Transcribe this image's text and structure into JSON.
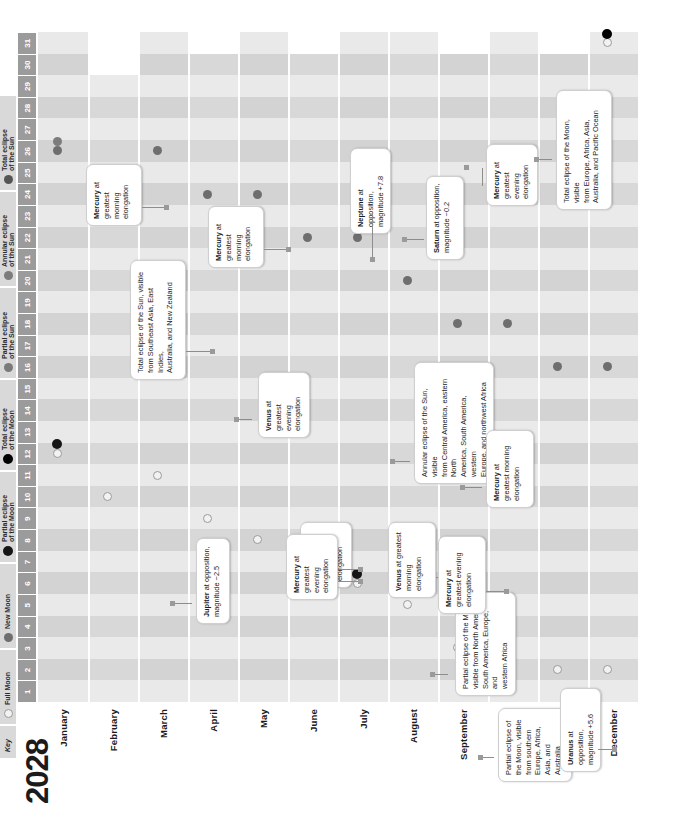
{
  "year": "2028",
  "key": {
    "title": "Key",
    "items": [
      {
        "label": "Full Moon",
        "icon": "full-moon-icon",
        "glyph": "dot-full"
      },
      {
        "label": "New Moon",
        "icon": "new-moon-icon",
        "glyph": "dot-new"
      },
      {
        "label": "Partial eclipse\nof the Moon",
        "icon": "partial-lunar-eclipse-icon",
        "glyph": "dot-plunar"
      },
      {
        "label": "Total eclipse\nof the Moon",
        "icon": "total-lunar-eclipse-icon",
        "glyph": "dot-tlunar"
      },
      {
        "label": "Partial eclipse\nof the Sun",
        "icon": "partial-solar-eclipse-icon",
        "glyph": "dot-psolar"
      },
      {
        "label": "Annular eclipse\nof the Sun",
        "icon": "annular-solar-eclipse-icon",
        "glyph": "dot-asolar"
      },
      {
        "label": "Total eclipse\nof the Sun",
        "icon": "total-solar-eclipse-icon",
        "glyph": "dot-tsolar"
      }
    ]
  },
  "days": [
    "1",
    "2",
    "3",
    "4",
    "5",
    "6",
    "7",
    "8",
    "9",
    "10",
    "11",
    "12",
    "13",
    "14",
    "15",
    "16",
    "17",
    "18",
    "19",
    "20",
    "21",
    "22",
    "23",
    "24",
    "25",
    "26",
    "27",
    "28",
    "29",
    "30",
    "31"
  ],
  "months": [
    {
      "name": "January",
      "days": 31
    },
    {
      "name": "February",
      "days": 29
    },
    {
      "name": "March",
      "days": 31
    },
    {
      "name": "April",
      "days": 30
    },
    {
      "name": "May",
      "days": 31
    },
    {
      "name": "June",
      "days": 30
    },
    {
      "name": "July",
      "days": 31
    },
    {
      "name": "August",
      "days": 31
    },
    {
      "name": "September",
      "days": 30
    },
    {
      "name": "October",
      "days": 31
    },
    {
      "name": "November",
      "days": 30
    },
    {
      "name": "December",
      "days": 31
    }
  ],
  "chart_data": {
    "type": "table",
    "title": "2028",
    "xlabel": "Day of month",
    "ylabel": "Month",
    "x": [
      "1",
      "2",
      "3",
      "4",
      "5",
      "6",
      "7",
      "8",
      "9",
      "10",
      "11",
      "12",
      "13",
      "14",
      "15",
      "16",
      "17",
      "18",
      "19",
      "20",
      "21",
      "22",
      "23",
      "24",
      "25",
      "26",
      "27",
      "28",
      "29",
      "30",
      "31"
    ],
    "categories": [
      "January",
      "February",
      "March",
      "April",
      "May",
      "June",
      "July",
      "August",
      "September",
      "October",
      "November",
      "December"
    ],
    "events": [
      {
        "month": "January",
        "day": 12,
        "type": "full-moon"
      },
      {
        "month": "January",
        "day": 12,
        "type": "partial-lunar-eclipse"
      },
      {
        "month": "January",
        "day": 26,
        "type": "new-moon"
      },
      {
        "month": "January",
        "day": 26,
        "type": "annular-solar-eclipse"
      },
      {
        "month": "February",
        "day": 10,
        "type": "full-moon"
      },
      {
        "month": "February",
        "day": 25,
        "type": "new-moon"
      },
      {
        "month": "March",
        "day": 11,
        "type": "full-moon"
      },
      {
        "month": "March",
        "day": 26,
        "type": "new-moon"
      },
      {
        "month": "April",
        "day": 9,
        "type": "full-moon"
      },
      {
        "month": "April",
        "day": 24,
        "type": "new-moon"
      },
      {
        "month": "May",
        "day": 8,
        "type": "full-moon"
      },
      {
        "month": "May",
        "day": 24,
        "type": "new-moon"
      },
      {
        "month": "June",
        "day": 7,
        "type": "full-moon"
      },
      {
        "month": "June",
        "day": 22,
        "type": "new-moon"
      },
      {
        "month": "July",
        "day": 6,
        "type": "full-moon"
      },
      {
        "month": "July",
        "day": 6,
        "type": "partial-lunar-eclipse"
      },
      {
        "month": "July",
        "day": 22,
        "type": "new-moon"
      },
      {
        "month": "July",
        "day": 22,
        "type": "total-solar-eclipse"
      },
      {
        "month": "August",
        "day": 5,
        "type": "full-moon"
      },
      {
        "month": "August",
        "day": 20,
        "type": "new-moon"
      },
      {
        "month": "September",
        "day": 3,
        "type": "full-moon"
      },
      {
        "month": "September",
        "day": 18,
        "type": "new-moon"
      },
      {
        "month": "October",
        "day": 3,
        "type": "full-moon"
      },
      {
        "month": "October",
        "day": 18,
        "type": "new-moon"
      },
      {
        "month": "November",
        "day": 2,
        "type": "full-moon"
      },
      {
        "month": "November",
        "day": 16,
        "type": "new-moon"
      },
      {
        "month": "December",
        "day": 2,
        "type": "full-moon"
      },
      {
        "month": "December",
        "day": 16,
        "type": "new-moon"
      },
      {
        "month": "December",
        "day": 31,
        "type": "full-moon"
      },
      {
        "month": "December",
        "day": 31,
        "type": "total-lunar-eclipse"
      }
    ],
    "annotations": [
      {
        "month": "January",
        "day": 12,
        "text": "Partial eclipse of the Moon,\nvisible from North America,\nSouth America, Europe, and\nwestern Africa",
        "bold": ""
      },
      {
        "month": "January",
        "day": 16,
        "text": "Mercury at greatest evening elongation",
        "bold": "Mercury"
      },
      {
        "month": "January",
        "day": 26,
        "text": "Annular eclipse of the Sun, visible\nfrom Central America, eastern North\nAmerica, South America, western\nEurope, and northwest Africa",
        "bold": ""
      },
      {
        "month": "February",
        "day": 29,
        "text": "Mercury at greatest morning elongation",
        "bold": "Mercury"
      },
      {
        "month": "March",
        "day": 13,
        "text": "Jupiter at opposition,\nmagnitude −2.5",
        "bold": "Jupiter"
      },
      {
        "month": "April",
        "day": 21,
        "text": "Venus at greatest evening elongation",
        "bold": "Venus"
      },
      {
        "month": "May",
        "day": 12,
        "text": "Mercury at greatest evening elongation",
        "bold": "Mercury"
      },
      {
        "month": "May",
        "day": 27,
        "text": "Mercury at greatest morning elongation",
        "bold": "Mercury"
      },
      {
        "month": "June",
        "day": 3,
        "text": "Partial eclipse of\nthe Moon, visible\nfrom southern\nEurope, Africa,\nAsia, and Australia",
        "bold": ""
      },
      {
        "month": "July",
        "day": 22,
        "text": "Total eclipse of the Sun, visible\nfrom Southeast Asia, East Indies,\nAustralia, and New Zealand",
        "bold": ""
      },
      {
        "month": "August",
        "day": 12,
        "text": "Venus at greatest morning elongation",
        "bold": "Venus"
      },
      {
        "month": "August",
        "day": 29,
        "text": "Neptune at opposition,\nmagnitude +7.8",
        "bold": "Neptune"
      },
      {
        "month": "September",
        "day": 11,
        "text": "Mercury at greatest evening elongation",
        "bold": "Mercury"
      },
      {
        "month": "October",
        "day": 16,
        "text": "Mercury at greatest morning elongation",
        "bold": "Mercury"
      },
      {
        "month": "October",
        "day": 27,
        "text": "Saturn at opposition,\nmagnitude −0.2",
        "bold": "Saturn"
      },
      {
        "month": "November",
        "day": 30,
        "text": "Mercury at greatest evening elongation",
        "bold": "Mercury"
      },
      {
        "month": "December",
        "day": 4,
        "text": "Uranus at opposition,\nmagnitude +5.6",
        "bold": "Uranus"
      },
      {
        "month": "December",
        "day": 31,
        "text": "Total eclipse of the Moon, visible\nfrom Europe, Africa, Asia,\nAustralia, and Pacific Ocean",
        "bold": ""
      }
    ]
  },
  "colors": {
    "band_light": "#e9e9e9",
    "band_dark": "#d2d2d2",
    "header": "#9b9b9b",
    "full_moon": "#f2f2f2",
    "new_moon": "#6e6e6e",
    "eclipse_dark": "#111111"
  }
}
